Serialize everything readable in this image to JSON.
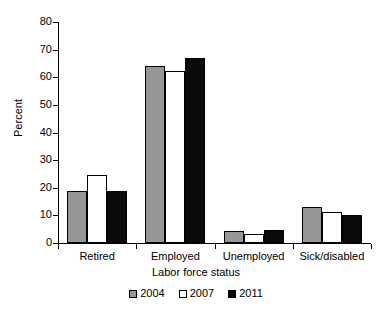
{
  "chart_data": {
    "type": "bar",
    "title": "",
    "subtitle": "",
    "xlabel": "Labor force status",
    "ylabel": "Percent",
    "categories": [
      "Retired",
      "Employed",
      "Unemployed",
      "Sick/disabled"
    ],
    "series": [
      {
        "name": "2004",
        "color": "#969696",
        "values": [
          18.7,
          64.0,
          4.5,
          12.9
        ]
      },
      {
        "name": "2007",
        "color": "#ffffff",
        "values": [
          24.5,
          62.4,
          3.4,
          11.2
        ]
      },
      {
        "name": "2011",
        "color": "#0a0a0a",
        "values": [
          18.8,
          67.0,
          4.6,
          10.0
        ]
      }
    ],
    "ylim": [
      0,
      80
    ],
    "yticks": [
      0,
      10,
      20,
      30,
      40,
      50,
      60,
      70,
      80
    ],
    "ytick_labels": [
      "0",
      "10",
      "20",
      "30",
      "40",
      "50",
      "60",
      "70",
      "80"
    ],
    "grid": false,
    "legend_position": "bottom"
  },
  "legend": {
    "entries": [
      {
        "label": "2004",
        "swatch": "legend-swatch-2004"
      },
      {
        "label": "2007",
        "swatch": "legend-swatch-2007"
      },
      {
        "label": "2011",
        "swatch": "legend-swatch-2011"
      }
    ]
  }
}
